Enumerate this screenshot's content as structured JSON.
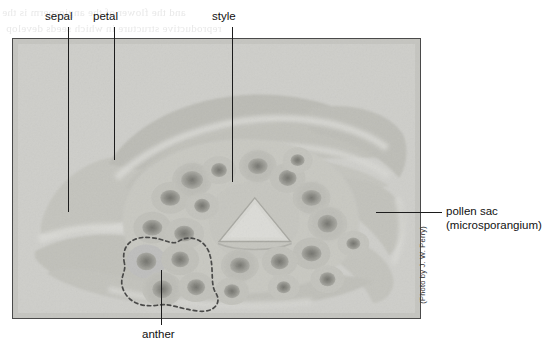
{
  "figure": {
    "kind": "labeled-micrograph",
    "photo_credit": "(Photo by J. W. Perry)"
  },
  "labels": {
    "sepal": "sepal",
    "petal": "petal",
    "style": "style",
    "pollen_sac_line1": "pollen sac",
    "pollen_sac_line2": "(microsporangium)",
    "anther": "anther"
  },
  "bleed_through": {
    "line1": "and the flower of the angiosperm is the",
    "line2": "reproductive structure in which seeds develop"
  },
  "colors": {
    "photo_background": "#cfcfcb",
    "photo_border": "#4a4a4a",
    "leader_line": "#1c1c1c",
    "label_text": "#111111",
    "tissue_light": "#d8d8d3",
    "tissue_mid": "#b9b9b3",
    "tissue_dark": "#8e8e88",
    "pollen_sac_core": "#5e5e58",
    "dashed_outline": "#101010"
  }
}
